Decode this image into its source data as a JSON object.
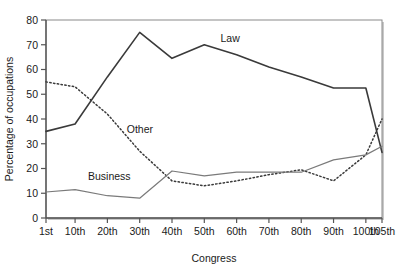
{
  "chart_data": {
    "type": "line",
    "title": "",
    "xlabel": "Congress",
    "ylabel": "Percentage of occupations",
    "x": [
      "1st",
      "10th",
      "20th",
      "30th",
      "40th",
      "50th",
      "60th",
      "70th",
      "80th",
      "90th",
      "100th",
      "105th"
    ],
    "x_values": [
      1,
      10,
      20,
      30,
      40,
      50,
      60,
      70,
      80,
      90,
      100,
      105
    ],
    "xlim": [
      1,
      105
    ],
    "ylim": [
      0,
      80
    ],
    "yticks": [
      0,
      10,
      20,
      30,
      40,
      50,
      60,
      70,
      80
    ],
    "xticks": [
      "1st",
      "10th",
      "20th",
      "30th",
      "40th",
      "50th",
      "60th",
      "70th",
      "80th",
      "90th",
      "100th",
      "105th"
    ],
    "grid": false,
    "legend": "inline-labels",
    "series": [
      {
        "name": "Law",
        "style": "solid",
        "color": "#3a3a3a",
        "width": 1.6,
        "label_x": 55,
        "label_y": 71,
        "values": [
          35,
          38,
          57,
          75,
          64.5,
          70,
          66,
          61,
          57,
          52.5,
          52.5,
          26.5
        ]
      },
      {
        "name": "Other",
        "style": "dotted",
        "color": "#3a3a3a",
        "width": 1.5,
        "label_x": 26,
        "label_y": 34.5,
        "values": [
          55,
          53,
          42,
          27,
          15,
          13,
          15,
          17.5,
          19.5,
          15,
          25.5,
          40
        ]
      },
      {
        "name": "Business",
        "style": "solid",
        "color": "#7a7a7a",
        "width": 1.2,
        "label_x": 14,
        "label_y": 15.5,
        "values": [
          10.5,
          11.5,
          9,
          8,
          19,
          17,
          18.5,
          18.5,
          18.5,
          23.5,
          25.5,
          29
        ]
      }
    ]
  },
  "figure": {
    "frame_color": "#808080",
    "axis_color": "#555555",
    "background": "#ffffff"
  }
}
